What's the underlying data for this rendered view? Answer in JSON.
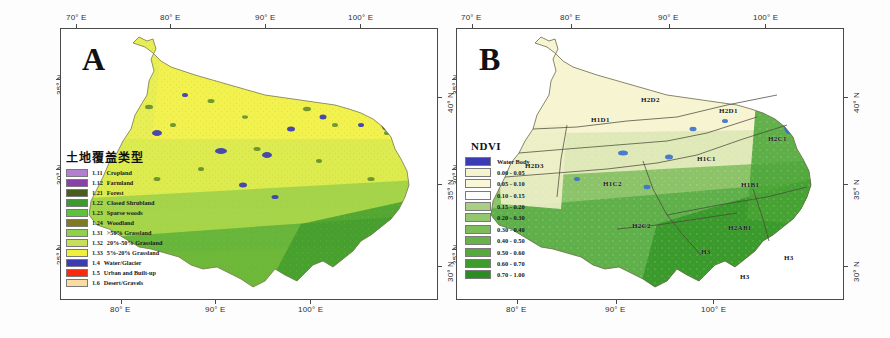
{
  "figure": {
    "panels": [
      {
        "id": "A",
        "letter": "A",
        "legend": {
          "title": "土地覆盖类型",
          "items": [
            {
              "code": "1.11",
              "label": "Cropland",
              "color": "#b57fd0"
            },
            {
              "code": "1.12",
              "label": "Farmland",
              "color": "#8b3fa8"
            },
            {
              "code": "1.21",
              "label": "Forest",
              "color": "#4a5c1e"
            },
            {
              "code": "1.22",
              "label": "Closed Shrubland",
              "color": "#3d9a2f"
            },
            {
              "code": "1.23",
              "label": "Sparse woods",
              "color": "#5fc13c"
            },
            {
              "code": "1.24",
              "label": "Woodland",
              "color": "#7f7a22"
            },
            {
              "code": "1.31",
              "label": ">50% Grassland",
              "color": "#8fd14a"
            },
            {
              "code": "1.32",
              "label": "20%-50% Grassland",
              "color": "#c7e05c"
            },
            {
              "code": "1.33",
              "label": "5%-20% Grassland",
              "color": "#f0f03c"
            },
            {
              "code": "1.4",
              "label": "Water/Glacier",
              "color": "#3b3bb5"
            },
            {
              "code": "1.5",
              "label": "Urban and Built-up",
              "color": "#fa2a10"
            },
            {
              "code": "1.6",
              "label": "Desert/Gravels",
              "color": "#fbdca0"
            }
          ]
        },
        "axes": {
          "top": [
            "70° E",
            "80° E",
            "90° E",
            "100° E"
          ],
          "bottom": [
            "80° E",
            "90° E",
            "100° E"
          ],
          "left": [
            "35° N",
            "30° N",
            "25° N"
          ],
          "right": [
            "40° N",
            "35° N",
            "30° N"
          ]
        }
      },
      {
        "id": "B",
        "letter": "B",
        "legend": {
          "title": "NDVI",
          "items": [
            {
              "label": "Water Body",
              "color": "#3b3bb5"
            },
            {
              "label": "0.00 - 0.05",
              "color": "#f5f2d0"
            },
            {
              "label": "0.05 - 0.10",
              "color": "#f9f7d8"
            },
            {
              "label": "0.10 - 0.15",
              "color": "#fefefe"
            },
            {
              "label": "0.15 - 0.20",
              "color": "#a8cf84"
            },
            {
              "label": "0.20 - 0.30",
              "color": "#93c76f"
            },
            {
              "label": "0.30 - 0.40",
              "color": "#7cbd5a"
            },
            {
              "label": "0.40 - 0.50",
              "color": "#68b349"
            },
            {
              "label": "0.50 - 0.60",
              "color": "#55a83b"
            },
            {
              "label": "0.60 - 0.70",
              "color": "#3f9b2e"
            },
            {
              "label": "0.70 - 1.00",
              "color": "#2b8c22"
            }
          ]
        },
        "regions": [
          {
            "code": "H2D2",
            "x": 198,
            "y": 96
          },
          {
            "code": "H1D1",
            "x": 148,
            "y": 116
          },
          {
            "code": "H2D1",
            "x": 276,
            "y": 107
          },
          {
            "code": "H2C1",
            "x": 325,
            "y": 135
          },
          {
            "code": "H2D3",
            "x": 82,
            "y": 162
          },
          {
            "code": "H1C2",
            "x": 160,
            "y": 180
          },
          {
            "code": "H1C1",
            "x": 254,
            "y": 155
          },
          {
            "code": "H1B1",
            "x": 298,
            "y": 181
          },
          {
            "code": "H2C2",
            "x": 189,
            "y": 222
          },
          {
            "code": "H2AB1",
            "x": 285,
            "y": 224
          },
          {
            "code": "H3",
            "x": 258,
            "y": 248
          },
          {
            "code": "H3",
            "x": 341,
            "y": 254
          },
          {
            "code": "H3",
            "x": 297,
            "y": 273
          }
        ],
        "axes": {
          "top": [
            "70° E",
            "80° E",
            "90° E",
            "100° E"
          ],
          "bottom": [
            "80° E",
            "90° E",
            "100° E"
          ],
          "left": [
            "35° N",
            "30° N",
            "25° N"
          ],
          "right": [
            "40° N",
            "35° N",
            "30° N"
          ]
        }
      }
    ]
  },
  "chart_data": {
    "type": "map",
    "panels": [
      {
        "panel": "A",
        "subtitle": "土地覆盖类型 (Land Cover Types)",
        "legend_title": "土地覆盖类型",
        "categories": [
          "1.11 Cropland",
          "1.12 Farmland",
          "1.21 Forest",
          "1.22 Closed Shrubland",
          "1.23 Sparse woods",
          "1.24 Woodland",
          "1.31 >50% Grassland",
          "1.32 20%-50% Grassland",
          "1.33 5%-20% Grassland",
          "1.4 Water/Glacier",
          "1.5 Urban and Built-up",
          "1.6 Desert/Gravels"
        ],
        "colors": [
          "#b57fd0",
          "#8b3fa8",
          "#4a5c1e",
          "#3d9a2f",
          "#5fc13c",
          "#7f7a22",
          "#8fd14a",
          "#c7e05c",
          "#f0f03c",
          "#3b3bb5",
          "#fa2a10",
          "#fbdca0"
        ],
        "xlabel": "Longitude (° E)",
        "ylabel": "Latitude (° N)",
        "xlim": [
          68,
          105
        ],
        "ylim": [
          25,
          41
        ],
        "xticks": [
          "70° E",
          "80° E",
          "90° E",
          "100° E"
        ],
        "yticks": [
          "25° N",
          "30° N",
          "35° N",
          "40° N"
        ],
        "grid": false,
        "legend_position": "inside-left"
      },
      {
        "panel": "B",
        "subtitle": "NDVI",
        "legend_title": "NDVI",
        "categories": [
          "Water Body",
          "0.00 - 0.05",
          "0.05 - 0.10",
          "0.10 - 0.15",
          "0.15 - 0.20",
          "0.20 - 0.30",
          "0.30 - 0.40",
          "0.40 - 0.50",
          "0.50 - 0.60",
          "0.60 - 0.70",
          "0.70 - 1.00"
        ],
        "bin_edges": [
          0.0,
          0.05,
          0.1,
          0.15,
          0.2,
          0.3,
          0.4,
          0.5,
          0.6,
          0.7,
          1.0
        ],
        "colors": [
          "#3b3bb5",
          "#f5f2d0",
          "#f9f7d8",
          "#fefefe",
          "#a8cf84",
          "#93c76f",
          "#7cbd5a",
          "#68b349",
          "#55a83b",
          "#3f9b2e",
          "#2b8c22"
        ],
        "annotations": [
          "H2D2",
          "H1D1",
          "H2D1",
          "H2C1",
          "H2D3",
          "H1C2",
          "H1C1",
          "H1B1",
          "H2C2",
          "H2AB1",
          "H3"
        ],
        "xlabel": "Longitude (° E)",
        "ylabel": "Latitude (° N)",
        "xlim": [
          68,
          105
        ],
        "ylim": [
          25,
          41
        ],
        "xticks": [
          "70° E",
          "80° E",
          "90° E",
          "100° E"
        ],
        "yticks": [
          "25° N",
          "30° N",
          "35° N",
          "40° N"
        ],
        "grid": false,
        "legend_position": "inside-left"
      }
    ]
  }
}
